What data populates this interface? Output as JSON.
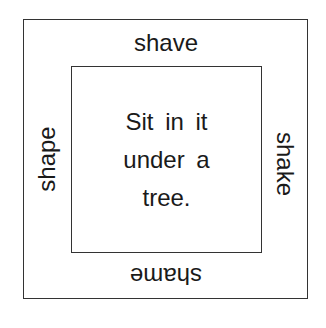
{
  "diagram": {
    "outer_words": {
      "top": "shave",
      "right": "shake",
      "bottom": "shame",
      "left": "shape"
    },
    "center_lines": [
      "Sit in it",
      "under a",
      "tree."
    ]
  }
}
